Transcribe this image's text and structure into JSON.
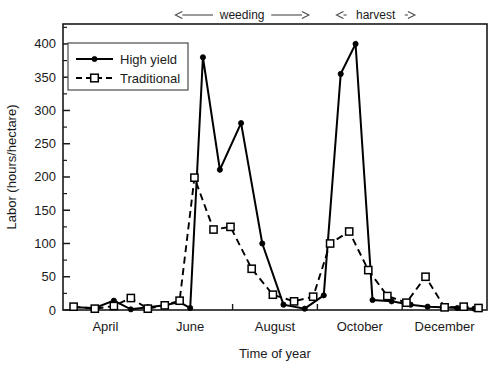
{
  "chart_data": {
    "type": "line",
    "title": "",
    "xlabel": "Time of year",
    "ylabel": "Labor (hours/hectare)",
    "ylim": [
      0,
      430
    ],
    "yticks": [
      0,
      50,
      100,
      150,
      200,
      250,
      300,
      350,
      400
    ],
    "ytick_labels": [
      "0",
      "50",
      "100",
      "150",
      "200",
      "250",
      "300",
      "350",
      "400"
    ],
    "y_minor_step": 25,
    "xlim": [
      0,
      20
    ],
    "xtick_labels": [
      "April",
      "June",
      "August",
      "October",
      "December"
    ],
    "xtick_positions": [
      2,
      6,
      10,
      14,
      18
    ],
    "x_minor_positions": [
      0,
      4,
      8,
      12,
      16,
      20
    ],
    "grid": false,
    "legend_position": "upper left",
    "series": [
      {
        "name": "High yield",
        "marker": "filled-circle",
        "linestyle": "solid",
        "color": "#000000",
        "x": [
          0.5,
          1.5,
          2.4,
          3.2,
          4.0,
          4.8,
          5.5,
          6.0,
          6.6,
          7.4,
          8.4,
          9.4,
          10.4,
          11.4,
          12.3,
          13.1,
          13.8,
          14.6,
          15.5,
          16.4,
          17.2,
          17.9,
          18.6,
          19.4
        ],
        "y": [
          4,
          3,
          14,
          1,
          4,
          7,
          12,
          3,
          380,
          211,
          281,
          100,
          8,
          2,
          22,
          355,
          400,
          15,
          13,
          8,
          5,
          4,
          3,
          2
        ]
      },
      {
        "name": "Traditional",
        "marker": "open-square",
        "linestyle": "dashed",
        "color": "#000000",
        "x": [
          0.5,
          1.5,
          2.4,
          3.2,
          4.0,
          4.8,
          5.5,
          6.2,
          7.1,
          7.9,
          8.9,
          9.9,
          10.9,
          11.8,
          12.6,
          13.5,
          14.4,
          15.3,
          16.2,
          17.1,
          18.0,
          18.9,
          19.6
        ],
        "y": [
          5,
          2,
          6,
          18,
          2,
          7,
          14,
          199,
          121,
          125,
          62,
          23,
          13,
          20,
          100,
          118,
          60,
          21,
          11,
          50,
          4,
          5,
          3
        ]
      }
    ],
    "annotations": [
      {
        "label": "weeding",
        "x_start": 5.3,
        "x_end": 11.6,
        "arrows": "both"
      },
      {
        "label": "harvest",
        "x_start": 12.9,
        "x_end": 16.6,
        "arrows": "both"
      }
    ]
  },
  "legend": {
    "entries": [
      {
        "label": "High yield"
      },
      {
        "label": "Traditional"
      }
    ]
  },
  "axes": {
    "y_title": "Labor (hours/hectare)",
    "x_title": "Time of year"
  }
}
